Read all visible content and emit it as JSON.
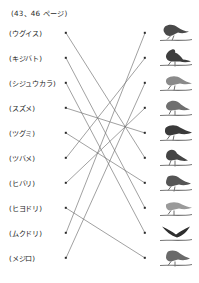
{
  "worksheet": {
    "page_reference": "(43、46 ページ)",
    "type": "matching-exercise",
    "left_column_label": "bird-names",
    "right_column_label": "bird-photos",
    "line_color": "#6d6d6d",
    "dot_color": "#2a2a2a",
    "rows": [
      {
        "index": 1,
        "name": "(ウグイス)",
        "y": 33,
        "bird_alt": "bird-photo-1-perched-warbler"
      },
      {
        "index": 2,
        "name": "(キジバト)",
        "y": 58,
        "bird_alt": "bird-photo-2-crested-bird"
      },
      {
        "index": 3,
        "name": "(シジュウカラ)",
        "y": 83,
        "bird_alt": "bird-photo-3-pale-songbird"
      },
      {
        "index": 4,
        "name": "(スズメ)",
        "y": 108,
        "bird_alt": "bird-photo-4-sparrow"
      },
      {
        "index": 5,
        "name": "(ツグミ)",
        "y": 133,
        "bird_alt": "bird-photo-5-dark-headed-bird"
      },
      {
        "index": 6,
        "name": "(ツバメ)",
        "y": 158,
        "bird_alt": "bird-photo-6-perched-thrush"
      },
      {
        "index": 7,
        "name": "(ヒバリ)",
        "y": 183,
        "bird_alt": "bird-photo-7-sparrow-on-branch"
      },
      {
        "index": 8,
        "name": "(ヒヨドリ)",
        "y": 208,
        "bird_alt": "bird-photo-8-pale-bird-branch"
      },
      {
        "index": 9,
        "name": "(ムクドリ)",
        "y": 233,
        "bird_alt": "bird-photo-9-swallow"
      },
      {
        "index": 10,
        "name": "(メジロ)",
        "y": 258,
        "bird_alt": "bird-photo-10-starling"
      }
    ],
    "left_dot_x": 66,
    "right_dot_x": 145,
    "connections": [
      {
        "from_row": 1,
        "to_row": 6
      },
      {
        "from_row": 2,
        "to_row": 8
      },
      {
        "from_row": 3,
        "to_row": 9
      },
      {
        "from_row": 4,
        "to_row": 5
      },
      {
        "from_row": 5,
        "to_row": 7
      },
      {
        "from_row": 6,
        "to_row": 2
      },
      {
        "from_row": 7,
        "to_row": 4
      },
      {
        "from_row": 8,
        "to_row": 10
      },
      {
        "from_row": 9,
        "to_row": 1
      },
      {
        "from_row": 10,
        "to_row": 3
      }
    ]
  }
}
